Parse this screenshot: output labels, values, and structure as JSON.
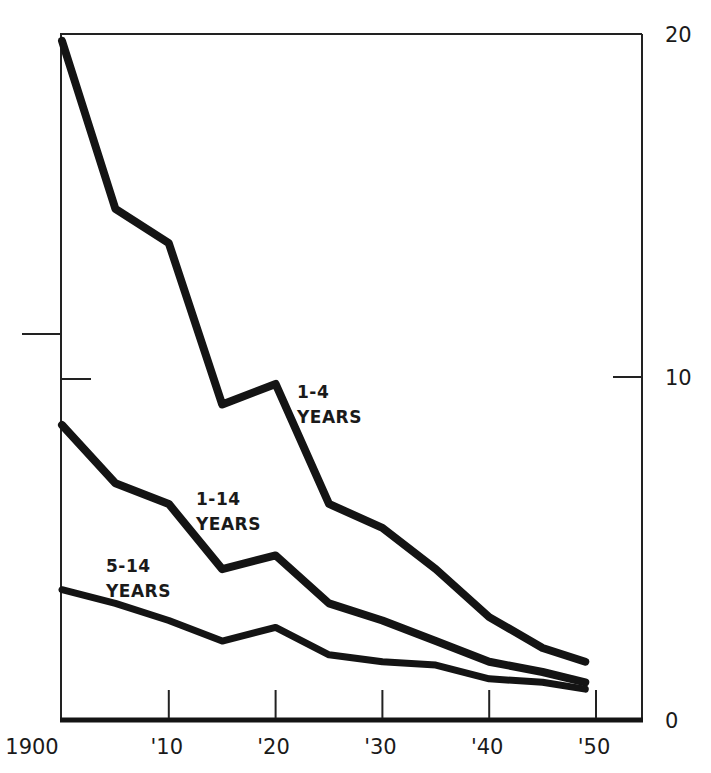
{
  "chart_data": {
    "type": "line",
    "title": "",
    "xlabel": "",
    "ylabel": "",
    "x": [
      1900,
      1905,
      1910,
      1915,
      1920,
      1925,
      1930,
      1935,
      1940,
      1945,
      1949
    ],
    "xlim": [
      1900,
      1955
    ],
    "ylim": [
      0,
      20
    ],
    "grid": false,
    "legend_position": "inline labels",
    "x_ticks": [
      {
        "value": 1900,
        "label": "1900"
      },
      {
        "value": 1910,
        "label": "'10"
      },
      {
        "value": 1920,
        "label": "'20"
      },
      {
        "value": 1930,
        "label": "'30"
      },
      {
        "value": 1940,
        "label": "'40"
      },
      {
        "value": 1950,
        "label": "'50"
      }
    ],
    "y_ticks_right": [
      {
        "value": 0,
        "label": "0"
      },
      {
        "value": 10,
        "label": "10"
      },
      {
        "value": 20,
        "label": "20"
      }
    ],
    "series": [
      {
        "name": "1-4 YEARS",
        "label_lines": [
          "1-4",
          "YEARS"
        ],
        "values": [
          19.8,
          14.9,
          13.9,
          9.2,
          9.8,
          6.3,
          5.6,
          4.4,
          3.0,
          2.1,
          1.7
        ]
      },
      {
        "name": "1-14 YEARS",
        "label_lines": [
          "1-14",
          "YEARS"
        ],
        "values": [
          8.6,
          6.9,
          6.3,
          4.4,
          4.8,
          3.4,
          2.9,
          2.3,
          1.7,
          1.4,
          1.1
        ]
      },
      {
        "name": "5-14 YEARS",
        "label_lines": [
          "5-14",
          "YEARS"
        ],
        "values": [
          3.8,
          3.4,
          2.9,
          2.3,
          2.7,
          1.9,
          1.7,
          1.6,
          1.2,
          1.1,
          0.9
        ]
      }
    ],
    "colors": {
      "ink": "#141414",
      "background": "#ffffff"
    }
  }
}
